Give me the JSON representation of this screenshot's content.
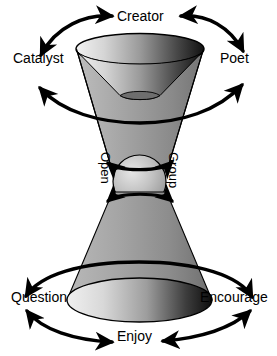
{
  "diagram": {
    "background_color": "#ffffff",
    "stroke_color": "#000000",
    "labels": {
      "top": "Creator",
      "top_left": "Catalyst",
      "top_right": "Poet",
      "center_left": "Open",
      "center_right": "Group",
      "bottom_left": "Question",
      "bottom_right": "Encourage",
      "bottom": "Enjoy"
    },
    "shapes": {
      "upper_cone_name": "upper-cone",
      "lower_cone_name": "lower-cone",
      "center_sphere_name": "center-sphere",
      "gradient_light": "#e8e8e8",
      "gradient_mid": "#9a9a9a",
      "gradient_dark": "#1a1a1a"
    },
    "arrows": [
      {
        "name": "arrow-catalyst-creator",
        "from": "Catalyst",
        "to": "Creator",
        "double_headed": true
      },
      {
        "name": "arrow-creator-poet",
        "from": "Creator",
        "to": "Poet",
        "double_headed": true
      },
      {
        "name": "arrow-catalyst-poet-lower",
        "from": "Catalyst",
        "to": "Poet",
        "double_headed": true
      },
      {
        "name": "arrow-open-group-upper",
        "from": "Open",
        "to": "Group",
        "double_headed": true
      },
      {
        "name": "arrow-open-group-lower",
        "from": "Open",
        "to": "Group",
        "double_headed": true
      },
      {
        "name": "arrow-question-encourage-upper",
        "from": "Question",
        "to": "Encourage",
        "double_headed": true
      },
      {
        "name": "arrow-question-enjoy",
        "from": "Question",
        "to": "Enjoy",
        "double_headed": true
      },
      {
        "name": "arrow-enjoy-encourage",
        "from": "Enjoy",
        "to": "Encourage",
        "double_headed": true
      }
    ]
  }
}
